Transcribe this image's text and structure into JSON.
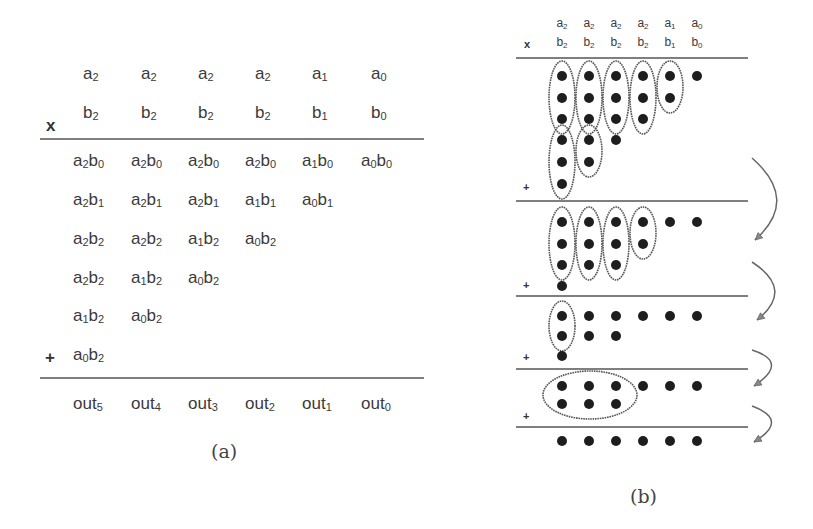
{
  "panel_a": {
    "caption": "(a)",
    "operator_multiply": "x",
    "operator_add": "+",
    "col_x": [
      73,
      131,
      188,
      245,
      302,
      361
    ],
    "operand_a": [
      [
        "a",
        "2"
      ],
      [
        "a",
        "2"
      ],
      [
        "a",
        "2"
      ],
      [
        "a",
        "2"
      ],
      [
        "a",
        "1"
      ],
      [
        "a",
        "0"
      ]
    ],
    "operand_b": [
      [
        "b",
        "2"
      ],
      [
        "b",
        "2"
      ],
      [
        "b",
        "2"
      ],
      [
        "b",
        "2"
      ],
      [
        "b",
        "1"
      ],
      [
        "b",
        "0"
      ]
    ],
    "partial_products": [
      [
        [
          "a",
          "2",
          "b",
          "0"
        ],
        [
          "a",
          "2",
          "b",
          "0"
        ],
        [
          "a",
          "2",
          "b",
          "0"
        ],
        [
          "a",
          "2",
          "b",
          "0"
        ],
        [
          "a",
          "1",
          "b",
          "0"
        ],
        [
          "a",
          "0",
          "b",
          "0"
        ]
      ],
      [
        [
          "a",
          "2",
          "b",
          "1"
        ],
        [
          "a",
          "2",
          "b",
          "1"
        ],
        [
          "a",
          "2",
          "b",
          "1"
        ],
        [
          "a",
          "1",
          "b",
          "1"
        ],
        [
          "a",
          "0",
          "b",
          "1"
        ]
      ],
      [
        [
          "a",
          "2",
          "b",
          "2"
        ],
        [
          "a",
          "2",
          "b",
          "2"
        ],
        [
          "a",
          "1",
          "b",
          "2"
        ],
        [
          "a",
          "0",
          "b",
          "2"
        ]
      ],
      [
        [
          "a",
          "2",
          "b",
          "2"
        ],
        [
          "a",
          "1",
          "b",
          "2"
        ],
        [
          "a",
          "0",
          "b",
          "2"
        ]
      ],
      [
        [
          "a",
          "1",
          "b",
          "2"
        ],
        [
          "a",
          "0",
          "b",
          "2"
        ]
      ],
      [
        [
          "a",
          "0",
          "b",
          "2"
        ]
      ]
    ],
    "outputs": [
      [
        "out",
        "5"
      ],
      [
        "out",
        "4"
      ],
      [
        "out",
        "3"
      ],
      [
        "out",
        "2"
      ],
      [
        "out",
        "1"
      ],
      [
        "out",
        "0"
      ]
    ]
  },
  "panel_b": {
    "caption": "(b)",
    "operator_multiply": "x",
    "operator_add": "+",
    "col_x": [
      562,
      589,
      616,
      643,
      670,
      697
    ],
    "operand_a": [
      [
        "a",
        "2"
      ],
      [
        "a",
        "2"
      ],
      [
        "a",
        "2"
      ],
      [
        "a",
        "2"
      ],
      [
        "a",
        "1"
      ],
      [
        "a",
        "0"
      ]
    ],
    "operand_b": [
      [
        "b",
        "2"
      ],
      [
        "b",
        "2"
      ],
      [
        "b",
        "2"
      ],
      [
        "b",
        "2"
      ],
      [
        "b",
        "1"
      ],
      [
        "b",
        "0"
      ]
    ],
    "stages": [
      {
        "label": "stage-0-partial-products",
        "dots": [
          [
            0,
            76
          ],
          [
            1,
            76
          ],
          [
            2,
            76
          ],
          [
            3,
            76
          ],
          [
            4,
            76
          ],
          [
            5,
            76
          ],
          [
            0,
            98
          ],
          [
            1,
            98
          ],
          [
            2,
            98
          ],
          [
            3,
            98
          ],
          [
            4,
            98
          ],
          [
            0,
            119
          ],
          [
            1,
            119
          ],
          [
            2,
            119
          ],
          [
            3,
            119
          ],
          [
            0,
            140
          ],
          [
            1,
            140
          ],
          [
            2,
            140
          ],
          [
            0,
            162
          ],
          [
            1,
            162
          ],
          [
            0,
            184
          ]
        ],
        "groups": [
          [
            0,
            76,
            119
          ],
          [
            1,
            76,
            119
          ],
          [
            2,
            76,
            119
          ],
          [
            3,
            76,
            119
          ],
          [
            4,
            76,
            98
          ],
          [
            0,
            140,
            184
          ],
          [
            1,
            140,
            162
          ]
        ]
      },
      {
        "label": "stage-1",
        "dots": [
          [
            0,
            222
          ],
          [
            1,
            222
          ],
          [
            2,
            222
          ],
          [
            3,
            222
          ],
          [
            4,
            222
          ],
          [
            5,
            222
          ],
          [
            0,
            244
          ],
          [
            1,
            244
          ],
          [
            2,
            244
          ],
          [
            3,
            244
          ],
          [
            0,
            265
          ],
          [
            1,
            265
          ],
          [
            2,
            265
          ],
          [
            0,
            286
          ]
        ],
        "groups": [
          [
            0,
            222,
            265
          ],
          [
            1,
            222,
            265
          ],
          [
            2,
            222,
            265
          ],
          [
            3,
            222,
            244
          ]
        ]
      },
      {
        "label": "stage-2",
        "dots": [
          [
            0,
            316
          ],
          [
            1,
            316
          ],
          [
            2,
            316
          ],
          [
            3,
            316
          ],
          [
            4,
            316
          ],
          [
            5,
            316
          ],
          [
            0,
            336
          ],
          [
            1,
            336
          ],
          [
            2,
            336
          ],
          [
            0,
            356
          ]
        ],
        "groups": [
          [
            0,
            316,
            336
          ]
        ]
      },
      {
        "label": "stage-3",
        "dots": [
          [
            0,
            386
          ],
          [
            1,
            386
          ],
          [
            2,
            386
          ],
          [
            3,
            386
          ],
          [
            4,
            386
          ],
          [
            5,
            386
          ],
          [
            0,
            404
          ],
          [
            1,
            404
          ],
          [
            2,
            404
          ]
        ],
        "wide_group": {
          "cx": 590,
          "cy": 395,
          "rx": 47,
          "ry": 24
        }
      },
      {
        "label": "stage-4-final",
        "dots": [
          [
            0,
            441
          ],
          [
            1,
            441
          ],
          [
            2,
            441
          ],
          [
            3,
            441
          ],
          [
            4,
            441
          ],
          [
            5,
            441
          ]
        ]
      }
    ],
    "separator_y": [
      58,
      201,
      296,
      369,
      427
    ],
    "plus_y": [
      189,
      287,
      359,
      418
    ],
    "arrows": [
      {
        "from": [
          752,
          158
        ],
        "ctrl": [
          800,
          200
        ],
        "to": [
          755,
          240
        ]
      },
      {
        "from": [
          752,
          262
        ],
        "ctrl": [
          795,
          290
        ],
        "to": [
          757,
          320
        ]
      },
      {
        "from": [
          752,
          350
        ],
        "ctrl": [
          790,
          362
        ],
        "to": [
          754,
          386
        ]
      },
      {
        "from": [
          752,
          406
        ],
        "ctrl": [
          790,
          420
        ],
        "to": [
          754,
          442
        ]
      }
    ]
  },
  "colors": {
    "ink": "#333333",
    "dot": "#1e1e1e",
    "line": "#555555",
    "ellipse": "#555555",
    "arrow": "#666666"
  }
}
